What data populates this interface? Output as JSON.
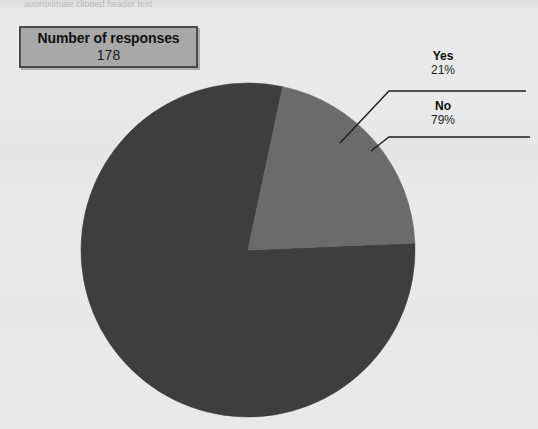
{
  "page": {
    "background_color": "#e9e9e9",
    "top_clipped_text": "approximate clipped header text"
  },
  "legend_box": {
    "title": "Number of responses",
    "value": "178",
    "fill_color": "#a8a8a8",
    "border_color": "#4a4a4a"
  },
  "labels": {
    "yes": {
      "name": "Yes",
      "percent": "21%"
    },
    "no": {
      "name": "No",
      "percent": "79%"
    }
  },
  "chart_data": {
    "type": "pie",
    "title": "",
    "subtitle": "",
    "xlabel": "",
    "ylabel": "",
    "grid": false,
    "legend_position": "none",
    "total_responses": 178,
    "categories": [
      "Yes",
      "No"
    ],
    "values": [
      21,
      79
    ],
    "value_labels": [
      "21%",
      "79%"
    ],
    "colors": [
      "#6b6b6b",
      "#3e3e3e"
    ],
    "slices": [
      {
        "label": "Yes",
        "percent": 21,
        "percent_label": "21%",
        "color": "#6b6b6b",
        "start_angle_deg": 12,
        "end_angle_deg": 88
      },
      {
        "label": "No",
        "percent": 79,
        "percent_label": "79%",
        "color": "#3e3e3e",
        "start_angle_deg": 88,
        "end_angle_deg": 372
      }
    ],
    "geometry": {
      "center_x": 248,
      "center_y": 250,
      "radius": 167
    },
    "annotations": [
      {
        "text": "Number of responses 178",
        "kind": "callout-box"
      },
      {
        "text": "Yes 21%",
        "kind": "leader-label"
      },
      {
        "text": "No 79%",
        "kind": "leader-label"
      }
    ]
  }
}
